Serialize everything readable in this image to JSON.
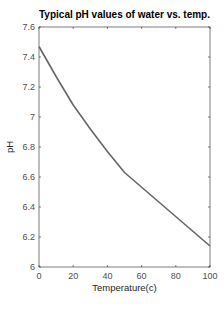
{
  "chart_data": {
    "type": "line",
    "title": "Typical pH values of water vs. temp.",
    "xlabel": "Temperature(c)",
    "ylabel": "pH",
    "xlim": [
      0,
      100
    ],
    "ylim": [
      6,
      7.6
    ],
    "xticks": [
      0,
      20,
      40,
      60,
      80,
      100
    ],
    "yticks": [
      6,
      6.2,
      6.4,
      6.6,
      6.8,
      7,
      7.2,
      7.4,
      7.6
    ],
    "xtick_labels": [
      "0",
      "20",
      "40",
      "60",
      "80",
      "100"
    ],
    "ytick_labels": [
      "6",
      "6.2",
      "6.4",
      "6.6",
      "6.8",
      "7",
      "7.2",
      "7.4",
      "7.6"
    ],
    "grid": false,
    "legend": null,
    "series": [
      {
        "name": "pH",
        "color": "#666666",
        "x": [
          0,
          10,
          20,
          25,
          30,
          40,
          50,
          100
        ],
        "y": [
          7.47,
          7.27,
          7.08,
          7.0,
          6.92,
          6.77,
          6.63,
          6.14
        ]
      }
    ]
  }
}
